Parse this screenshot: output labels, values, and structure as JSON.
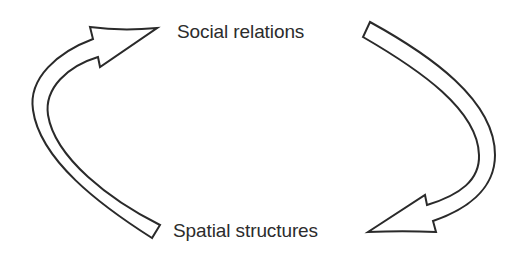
{
  "diagram": {
    "type": "cycle",
    "nodes": [
      {
        "id": "social",
        "label": "Social relations"
      },
      {
        "id": "spatial",
        "label": "Spatial structures"
      }
    ],
    "edges": [
      {
        "from": "social",
        "to": "spatial",
        "side": "right",
        "style": "hollow-curved-arrow"
      },
      {
        "from": "spatial",
        "to": "social",
        "side": "left",
        "style": "hollow-curved-arrow"
      }
    ],
    "colors": {
      "stroke": "#2a2a2a",
      "fill": "#ffffff",
      "text": "#2c2c2c",
      "background": "#ffffff"
    }
  }
}
